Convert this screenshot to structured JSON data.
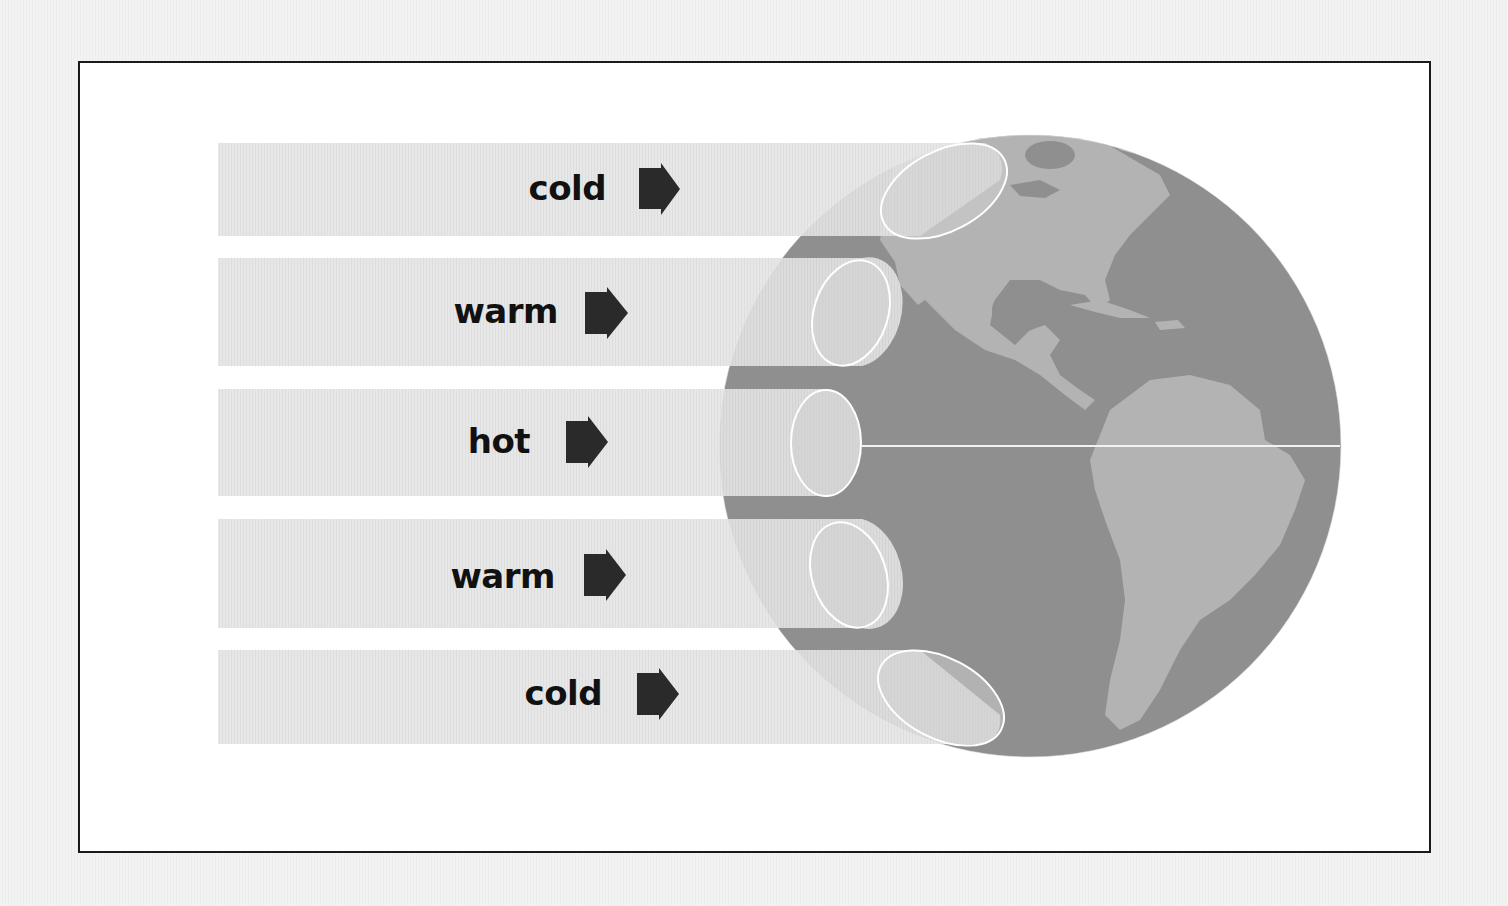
{
  "diagram": {
    "bands": [
      {
        "label": "cold",
        "position": "north-polar"
      },
      {
        "label": "warm",
        "position": "north-mid"
      },
      {
        "label": "hot",
        "position": "equator"
      },
      {
        "label": "warm",
        "position": "south-mid"
      },
      {
        "label": "cold",
        "position": "south-polar"
      }
    ],
    "arrow_icon": "right-arrow-icon",
    "globe": {
      "view": "Americas",
      "equator_line": true
    },
    "colors": {
      "band": "#e2e2e2",
      "ocean": "#8e8e8e",
      "land": "#b4b4b4",
      "arrow": "#2a2a2a",
      "text": "#111111",
      "frame_border": "#1a1a1a",
      "ellipse_outline": "#ffffff"
    }
  }
}
